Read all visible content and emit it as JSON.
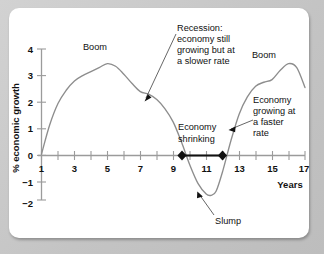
{
  "figure": {
    "background_color": "#c9c9c9",
    "card_color": "#ffffff",
    "curve_color": "#8d8d8d",
    "axis_color": "#9b9b9b",
    "marker_color": "#111111"
  },
  "labels": {
    "ylabel": "% economic growth",
    "xlabel": "Years",
    "boom_left": "Boom",
    "boom_right": "Boom",
    "slump": "Slump",
    "economy_shrinking_line1": "Economy",
    "economy_shrinking_line2": "shrinking",
    "recession_line1": "Recession:",
    "recession_line2": "economy still",
    "recession_line3": "growing but at",
    "recession_line4": "a slower rate",
    "faster_line1": "Economy",
    "faster_line2": "growing at",
    "faster_line3": "a faster",
    "faster_line4": "rate"
  },
  "ticks": {
    "y": [
      "4",
      "3",
      "2",
      "1",
      "0",
      "−1",
      "−2"
    ],
    "x": [
      "1",
      "3",
      "5",
      "7",
      "9",
      "11",
      "13",
      "15",
      "17"
    ]
  },
  "chart_data": {
    "type": "line",
    "title": "",
    "xlabel": "Years",
    "ylabel": "% economic growth",
    "xlim": [
      1,
      17
    ],
    "ylim": [
      -2,
      4
    ],
    "grid": false,
    "legend": "none",
    "x": [
      1,
      1.5,
      2,
      2.5,
      3,
      3.5,
      4,
      4.5,
      5,
      5.5,
      6,
      6.5,
      7,
      7.5,
      8,
      8.5,
      9,
      9.5,
      10,
      10.5,
      11,
      11.3,
      11.6,
      12,
      12.5,
      13,
      13.5,
      14,
      14.5,
      15,
      15.5,
      16,
      16.5,
      17
    ],
    "y": [
      0.05,
      1.15,
      1.95,
      2.45,
      2.8,
      3.0,
      3.15,
      3.3,
      3.45,
      3.35,
      3.05,
      2.7,
      2.4,
      2.3,
      2.1,
      1.75,
      1.25,
      0.5,
      -0.35,
      -1.05,
      -1.45,
      -1.5,
      -1.35,
      -0.6,
      0.55,
      1.55,
      2.2,
      2.6,
      2.75,
      2.85,
      3.2,
      3.45,
      3.3,
      2.55
    ],
    "series": [
      {
        "name": "% economic growth",
        "values": [
          0.05,
          1.15,
          1.95,
          2.45,
          2.8,
          3.0,
          3.15,
          3.3,
          3.45,
          3.35,
          3.05,
          2.7,
          2.4,
          2.3,
          2.1,
          1.75,
          1.25,
          0.5,
          -0.35,
          -1.05,
          -1.45,
          -1.5,
          -1.35,
          -0.6,
          0.55,
          1.55,
          2.2,
          2.6,
          2.75,
          2.85,
          3.2,
          3.45,
          3.3,
          2.55
        ]
      }
    ],
    "markers": [
      {
        "x": 9.5,
        "y": 0,
        "label": "zero-crossing-down"
      },
      {
        "x": 12.0,
        "y": 0,
        "label": "zero-crossing-up"
      }
    ],
    "annotations": [
      {
        "text": "Boom",
        "x": 4.3,
        "y": 3.95
      },
      {
        "text": "Recession: economy still growing but at a slower rate",
        "x": 9.0,
        "y": 4.3,
        "points_to": {
          "x": 7.0,
          "y": 2.35
        }
      },
      {
        "text": "Boom",
        "x": 15.3,
        "y": 3.7
      },
      {
        "text": "Economy growing at a faster rate",
        "x": 13.3,
        "y": 2.3,
        "points_to": {
          "x": 12.45,
          "y": 0.95
        }
      },
      {
        "text": "Economy shrinking",
        "x": 10.0,
        "y": 1.1
      },
      {
        "text": "Slump",
        "x": 12.2,
        "y": -2.6,
        "points_to": {
          "x": 11.4,
          "y": -1.5
        }
      }
    ]
  }
}
